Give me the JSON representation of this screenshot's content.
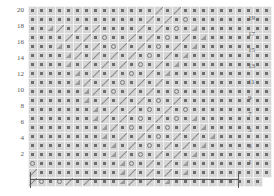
{
  "chart_data": {
    "type": "heatmap",
    "title": "",
    "xlabel": "",
    "ylabel": "",
    "grid": true,
    "legend_position": "none",
    "rows": 20,
    "columns": 27,
    "row_label_left": [
      "20",
      "18",
      "16",
      "14",
      "12",
      "10",
      "8",
      "6",
      "4",
      "2"
    ],
    "row_label_right": [
      "19",
      "17",
      "15",
      "13",
      "11",
      "9",
      "7",
      "5",
      "3",
      "1"
    ],
    "symbol_legend": {
      "dot": "purl-stitch",
      "circle": "yarn-over",
      "slash": "right-leaning-decrease",
      "tri": "left-leaning-decrease",
      "blank": "empty"
    },
    "cells": [
      [
        "dot",
        "dot",
        "dot",
        "dot",
        "dot",
        "dot",
        "dot",
        "dot",
        "dot",
        "dot",
        "dot",
        "dot",
        "dot",
        "dot",
        "slash",
        "dot",
        "slash",
        "dot",
        "dot",
        "dot",
        "dot",
        "dot",
        "dot",
        "dot",
        "dot",
        "dot",
        "dot"
      ],
      [
        "dot",
        "dot",
        "dot",
        "dot",
        "dot",
        "dot",
        "dot",
        "dot",
        "dot",
        "dot",
        "dot",
        "dot",
        "dot",
        "slash",
        "dot",
        "slash",
        "dot",
        "circle",
        "dot",
        "dot",
        "dot",
        "dot",
        "dot",
        "dot",
        "dot",
        "dot",
        "dot"
      ],
      [
        "dot",
        "dot",
        "tri",
        "slash",
        "dot",
        "slash",
        "dot",
        "slash",
        "dot",
        "dot",
        "dot",
        "dot",
        "slash",
        "dot",
        "slash",
        "dot",
        "circle",
        "dot",
        "tri",
        "dot",
        "dot",
        "dot",
        "dot",
        "dot",
        "dot",
        "dot",
        "dot"
      ],
      [
        "dot",
        "dot",
        "dot",
        "dot",
        "slash",
        "dot",
        "slash",
        "dot",
        "circle",
        "dot",
        "dot",
        "slash",
        "dot",
        "slash",
        "dot",
        "circle",
        "dot",
        "slash",
        "dot",
        "tri",
        "dot",
        "dot",
        "dot",
        "dot",
        "dot",
        "dot",
        "dot"
      ],
      [
        "dot",
        "dot",
        "dot",
        "tri",
        "dot",
        "slash",
        "dot",
        "slash",
        "dot",
        "circle",
        "slash",
        "dot",
        "slash",
        "dot",
        "circle",
        "dot",
        "slash",
        "dot",
        "tri",
        "dot",
        "dot",
        "dot",
        "dot",
        "dot",
        "dot",
        "dot",
        "dot"
      ],
      [
        "dot",
        "dot",
        "dot",
        "dot",
        "tri",
        "slash",
        "dot",
        "slash",
        "dot",
        "slash",
        "dot",
        "slash",
        "dot",
        "circle",
        "dot",
        "slash",
        "dot",
        "tri",
        "dot",
        "dot",
        "dot",
        "dot",
        "dot",
        "dot",
        "dot",
        "dot",
        "dot"
      ],
      [
        "dot",
        "dot",
        "dot",
        "dot",
        "tri",
        "dot",
        "slash",
        "dot",
        "slash",
        "dot",
        "slash",
        "dot",
        "circle",
        "dot",
        "slash",
        "dot",
        "tri",
        "dot",
        "dot",
        "dot",
        "dot",
        "dot",
        "dot",
        "dot",
        "dot",
        "dot",
        "dot"
      ],
      [
        "dot",
        "dot",
        "dot",
        "dot",
        "dot",
        "tri",
        "dot",
        "slash",
        "dot",
        "slash",
        "dot",
        "circle",
        "dot",
        "slash",
        "dot",
        "tri",
        "dot",
        "dot",
        "dot",
        "dot",
        "dot",
        "dot",
        "dot",
        "dot",
        "dot",
        "dot",
        "dot"
      ],
      [
        "dot",
        "dot",
        "dot",
        "dot",
        "dot",
        "tri",
        "slash",
        "dot",
        "slash",
        "dot",
        "circle",
        "dot",
        "slash",
        "dot",
        "slash",
        "dot",
        "dot",
        "dot",
        "dot",
        "dot",
        "dot",
        "dot",
        "dot",
        "dot",
        "dot",
        "dot",
        "dot"
      ],
      [
        "dot",
        "dot",
        "dot",
        "dot",
        "dot",
        "dot",
        "tri",
        "slash",
        "dot",
        "circle",
        "dot",
        "slash",
        "dot",
        "slash",
        "dot",
        "dot",
        "circle",
        "dot",
        "dot",
        "dot",
        "dot",
        "dot",
        "dot",
        "dot",
        "dot",
        "dot",
        "dot"
      ],
      [
        "dot",
        "dot",
        "dot",
        "dot",
        "dot",
        "dot",
        "tri",
        "dot",
        "slash",
        "dot",
        "slash",
        "dot",
        "slash",
        "dot",
        "circle",
        "dot",
        "slash",
        "dot",
        "dot",
        "dot",
        "dot",
        "dot",
        "dot",
        "dot",
        "dot",
        "dot",
        "dot"
      ],
      [
        "dot",
        "dot",
        "dot",
        "dot",
        "dot",
        "dot",
        "dot",
        "tri",
        "dot",
        "slash",
        "dot",
        "slash",
        "dot",
        "circle",
        "dot",
        "slash",
        "dot",
        "circle",
        "dot",
        "dot",
        "dot",
        "dot",
        "dot",
        "dot",
        "dot",
        "dot",
        "dot"
      ],
      [
        "dot",
        "dot",
        "dot",
        "dot",
        "dot",
        "dot",
        "dot",
        "tri",
        "slash",
        "dot",
        "slash",
        "dot",
        "circle",
        "dot",
        "slash",
        "dot",
        "circle",
        "dot",
        "tri",
        "dot",
        "dot",
        "dot",
        "dot",
        "dot",
        "dot",
        "dot",
        "dot"
      ],
      [
        "dot",
        "dot",
        "dot",
        "dot",
        "dot",
        "dot",
        "dot",
        "dot",
        "tri",
        "slash",
        "dot",
        "circle",
        "dot",
        "slash",
        "dot",
        "circle",
        "dot",
        "slash",
        "dot",
        "tri",
        "dot",
        "dot",
        "dot",
        "dot",
        "dot",
        "dot",
        "dot"
      ],
      [
        "dot",
        "dot",
        "dot",
        "dot",
        "dot",
        "dot",
        "dot",
        "dot",
        "tri",
        "dot",
        "slash",
        "dot",
        "slash",
        "dot",
        "circle",
        "dot",
        "slash",
        "dot",
        "slash",
        "dot",
        "tri",
        "dot",
        "dot",
        "dot",
        "dot",
        "dot",
        "dot"
      ],
      [
        "dot",
        "dot",
        "dot",
        "dot",
        "dot",
        "dot",
        "dot",
        "dot",
        "dot",
        "tri",
        "dot",
        "slash",
        "dot",
        "circle",
        "dot",
        "slash",
        "dot",
        "slash",
        "dot",
        "tri",
        "dot",
        "dot",
        "dot",
        "dot",
        "dot",
        "dot",
        "dot"
      ],
      [
        "dot",
        "dot",
        "dot",
        "dot",
        "dot",
        "dot",
        "dot",
        "dot",
        "dot",
        "tri",
        "slash",
        "dot",
        "circle",
        "dot",
        "slash",
        "dot",
        "slash",
        "dot",
        "tri",
        "dot",
        "dot",
        "dot",
        "dot",
        "dot",
        "dot",
        "dot",
        "dot"
      ],
      [
        "circle",
        "dot",
        "dot",
        "dot",
        "dot",
        "dot",
        "dot",
        "dot",
        "dot",
        "dot",
        "tri",
        "circle",
        "dot",
        "slash",
        "dot",
        "slash",
        "dot",
        "tri",
        "dot",
        "dot",
        "dot",
        "dot",
        "dot",
        "dot",
        "dot",
        "dot",
        "dot"
      ],
      [
        "slash",
        "dot",
        "dot",
        "dot",
        "dot",
        "dot",
        "dot",
        "dot",
        "dot",
        "dot",
        "tri",
        "slash",
        "dot",
        "slash",
        "dot",
        "slash",
        "dot",
        "tri",
        "dot",
        "dot",
        "dot",
        "dot",
        "dot",
        "dot",
        "dot",
        "dot",
        "dot"
      ],
      [
        "slash",
        "circle",
        "dot",
        "circle",
        "slash",
        "dot",
        "slash",
        "dot",
        "dot",
        "dot",
        "tri",
        "slash",
        "dot",
        "slash",
        "dot",
        "tri",
        "dot",
        "dot",
        "dot",
        "dot",
        "dot",
        "dot",
        "dot",
        "dot",
        "dot",
        "dot"
      ]
    ]
  },
  "repeat_bracket": {
    "label": "",
    "name": "pattern-repeat-bracket"
  }
}
